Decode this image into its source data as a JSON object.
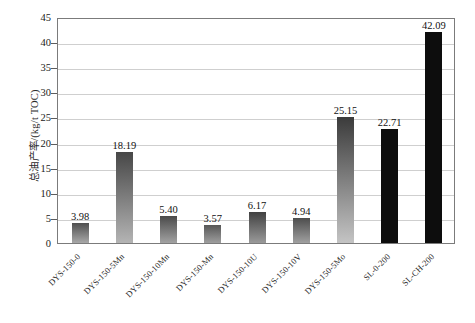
{
  "chart_data": {
    "type": "bar",
    "title": "",
    "xlabel": "",
    "ylabel": "总油产率/(kg/t TOC)",
    "ylim": [
      0,
      45
    ],
    "yticks": [
      0,
      5,
      10,
      15,
      20,
      25,
      30,
      35,
      40,
      45
    ],
    "ytick_labels": [
      "0",
      "5",
      "10",
      "15",
      "20",
      "25",
      "30",
      "35",
      "40",
      "45"
    ],
    "grid": true,
    "legend": "none",
    "categories": [
      "DYS-150-0",
      "DYS-150-5Mn",
      "DYS-150-10Mn",
      "DYS-150-Mn",
      "DYS-150-10U",
      "DYS-150-10V",
      "DYS-150-5Mo",
      "SL-0-200",
      "SL-CH-200"
    ],
    "values": [
      3.98,
      18.19,
      5.4,
      3.57,
      6.17,
      4.94,
      25.15,
      22.71,
      42.09
    ],
    "value_labels": [
      "3.98",
      "18.19",
      "5.40",
      "3.57",
      "6.17",
      "4.94",
      "25.15",
      "22.71",
      "42.09"
    ],
    "bar_styles": [
      {
        "top": "#4f4f4f",
        "bottom": "#a8a8a8"
      },
      {
        "top": "#474747",
        "bottom": "#b4b4b4"
      },
      {
        "top": "#4a4a4a",
        "bottom": "#a2a2a2"
      },
      {
        "top": "#575757",
        "bottom": "#9e9e9e"
      },
      {
        "top": "#414141",
        "bottom": "#9a9a9a"
      },
      {
        "top": "#4d4d4d",
        "bottom": "#a0a0a0"
      },
      {
        "top": "#3b3b3b",
        "bottom": "#c4c4c4"
      },
      {
        "top": "#0d0d0d",
        "bottom": "#0d0d0d"
      },
      {
        "top": "#0d0d0d",
        "bottom": "#0d0d0d"
      }
    ]
  },
  "colors": {
    "axis": "#7b7b7b",
    "grid": "#cfcfcf",
    "text": "#1a1a1a",
    "background": "#ffffff"
  }
}
